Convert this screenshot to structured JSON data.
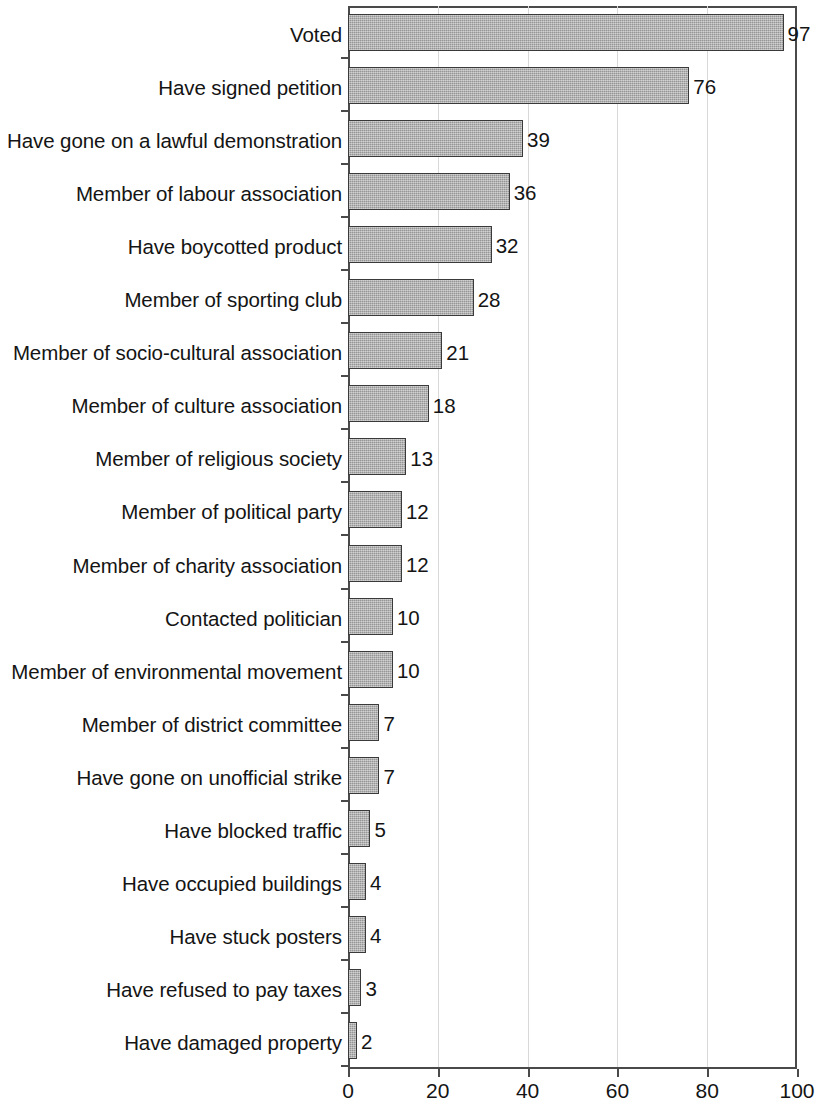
{
  "chart_data": {
    "type": "bar",
    "orientation": "horizontal",
    "title": "",
    "subtitle": "",
    "xlabel": "",
    "ylabel": "",
    "xlim": [
      0,
      100
    ],
    "xticks": [
      0,
      20,
      40,
      60,
      80,
      100
    ],
    "xtick_labels": [
      "0",
      "20",
      "40",
      "60",
      "80",
      "100"
    ],
    "grid": "vertical-light",
    "legend": "none",
    "show_value_labels": true,
    "bar_color": "#a9a9a9",
    "bar_edge_color": "#3a3a3a",
    "axis_color": "#4a4a4a",
    "gridline_color": "#d8d8d8",
    "categories": [
      "Voted",
      "Have signed petition",
      "Have gone on a lawful demonstration",
      "Member of labour association",
      "Have boycotted product",
      "Member of sporting club",
      "Member of socio-cultural association",
      "Member of culture association",
      "Member of religious society",
      "Member of political party",
      "Member of charity association",
      "Contacted politician",
      "Member of environmental movement",
      "Member of district committee",
      "Have gone on unofficial strike",
      "Have blocked traffic",
      "Have occupied buildings",
      "Have stuck posters",
      "Have refused to pay taxes",
      "Have damaged property"
    ],
    "values": [
      97,
      76,
      39,
      36,
      32,
      28,
      21,
      18,
      13,
      12,
      12,
      10,
      10,
      7,
      7,
      5,
      4,
      4,
      3,
      2
    ],
    "value_labels": [
      "97",
      "76",
      "39",
      "36",
      "32",
      "28",
      "21",
      "18",
      "13",
      "12",
      "12",
      "10",
      "10",
      "7",
      "7",
      "5",
      "4",
      "4",
      "3",
      "2"
    ]
  }
}
